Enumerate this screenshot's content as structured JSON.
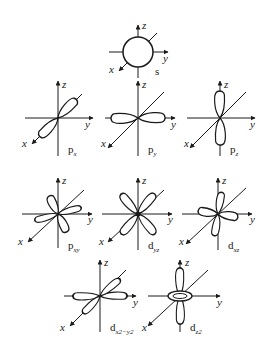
{
  "axis_labels": {
    "x": "x",
    "y": "y",
    "z": "z"
  },
  "orbitals": [
    {
      "id": "s",
      "main": "s",
      "sub": ""
    },
    {
      "id": "px",
      "main": "p",
      "sub": "x"
    },
    {
      "id": "py",
      "main": "p",
      "sub": "y"
    },
    {
      "id": "pz",
      "main": "p",
      "sub": "z"
    },
    {
      "id": "pxy",
      "main": "p",
      "sub": "xy"
    },
    {
      "id": "dyz",
      "main": "d",
      "sub": "yz"
    },
    {
      "id": "dxz",
      "main": "d",
      "sub": "xz"
    },
    {
      "id": "dx2y2",
      "main": "d",
      "sub": "x2−y2"
    },
    {
      "id": "dz2",
      "main": "d",
      "sub": "z2"
    }
  ],
  "colors": {
    "line": "#1a1a1a",
    "background": "#ffffff"
  }
}
